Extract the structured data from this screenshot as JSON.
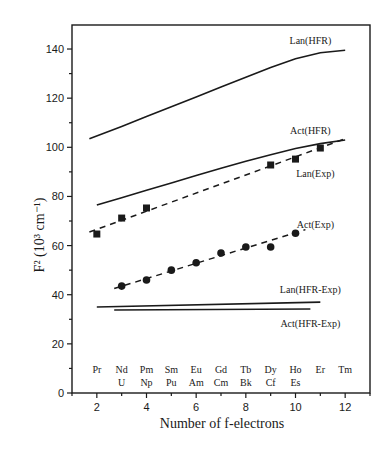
{
  "chart_data": {
    "type": "line",
    "title": "",
    "xlabel": "Number of f-electrons",
    "ylabel": "F² (10³ cm⁻¹)",
    "xlim": [
      1,
      13
    ],
    "ylim": [
      0,
      150
    ],
    "x_ticks": [
      2,
      4,
      6,
      8,
      10,
      12
    ],
    "y_ticks": [
      0,
      20,
      40,
      60,
      80,
      100,
      120,
      140
    ],
    "grid": false,
    "element_labels": {
      "lanthanides": [
        {
          "x": 2,
          "label": "Pr"
        },
        {
          "x": 3,
          "label": "Nd"
        },
        {
          "x": 4,
          "label": "Pm"
        },
        {
          "x": 5,
          "label": "Sm"
        },
        {
          "x": 6,
          "label": "Eu"
        },
        {
          "x": 7,
          "label": "Gd"
        },
        {
          "x": 8,
          "label": "Tb"
        },
        {
          "x": 9,
          "label": "Dy"
        },
        {
          "x": 10,
          "label": "Ho"
        },
        {
          "x": 11,
          "label": "Er"
        },
        {
          "x": 12,
          "label": "Tm"
        }
      ],
      "actinides": [
        {
          "x": 3,
          "label": "U"
        },
        {
          "x": 4,
          "label": "Np"
        },
        {
          "x": 5,
          "label": "Pu"
        },
        {
          "x": 6,
          "label": "Am"
        },
        {
          "x": 7,
          "label": "Cm"
        },
        {
          "x": 8,
          "label": "Bk"
        },
        {
          "x": 9,
          "label": "Cf"
        },
        {
          "x": 10,
          "label": "Es"
        }
      ]
    },
    "series": [
      {
        "name": "Lan(HFR)",
        "style": "solid",
        "marker": "none",
        "x": [
          1.7,
          3,
          4,
          5,
          6,
          7,
          8,
          9,
          10,
          11,
          12
        ],
        "values": [
          103.5,
          108.5,
          112.5,
          116.5,
          120.5,
          124.5,
          128.5,
          132.5,
          136,
          138.5,
          139.5
        ],
        "label_pos": {
          "x": 10.6,
          "y": 142
        }
      },
      {
        "name": "Act(HFR)",
        "style": "solid",
        "marker": "none",
        "x": [
          2,
          3,
          4,
          5,
          6,
          7,
          8,
          9,
          10,
          11,
          12
        ],
        "values": [
          76.5,
          79.5,
          82.5,
          85.5,
          88.5,
          91.5,
          94.3,
          97,
          99.5,
          101.5,
          103
        ],
        "label_pos": {
          "x": 10.6,
          "y": 105.5
        }
      },
      {
        "name": "Lan(Exp)",
        "style": "dashed",
        "marker": "square",
        "x": [
          2,
          3,
          4,
          9,
          10,
          11
        ],
        "values": [
          64.7,
          71.2,
          75.3,
          92.8,
          95.2,
          99.7
        ],
        "fit": {
          "x": [
            1.7,
            12
          ],
          "values": [
            65.5,
            103.5
          ]
        },
        "label_pos": {
          "x": 10.8,
          "y": 88
        }
      },
      {
        "name": "Act(Exp)",
        "style": "dashed",
        "marker": "circle",
        "x": [
          3,
          4,
          5,
          6,
          7,
          8,
          9,
          10
        ],
        "values": [
          43.5,
          46,
          50,
          53,
          57,
          59.4,
          59.4,
          65
        ],
        "fit": {
          "x": [
            2.7,
            10.4
          ],
          "values": [
            42.5,
            66.5
          ]
        },
        "label_pos": {
          "x": 10.8,
          "y": 67
        }
      },
      {
        "name": "Lan(HFR-Exp)",
        "style": "solid",
        "marker": "none",
        "x": [
          2,
          11
        ],
        "values": [
          35,
          37
        ],
        "label_pos": {
          "x": 10.6,
          "y": 40.5
        }
      },
      {
        "name": "Act(HFR-Exp)",
        "style": "solid",
        "marker": "none",
        "x": [
          2.7,
          10.6
        ],
        "values": [
          33.8,
          34.2
        ],
        "label_pos": {
          "x": 10.6,
          "y": 27
        }
      }
    ]
  }
}
